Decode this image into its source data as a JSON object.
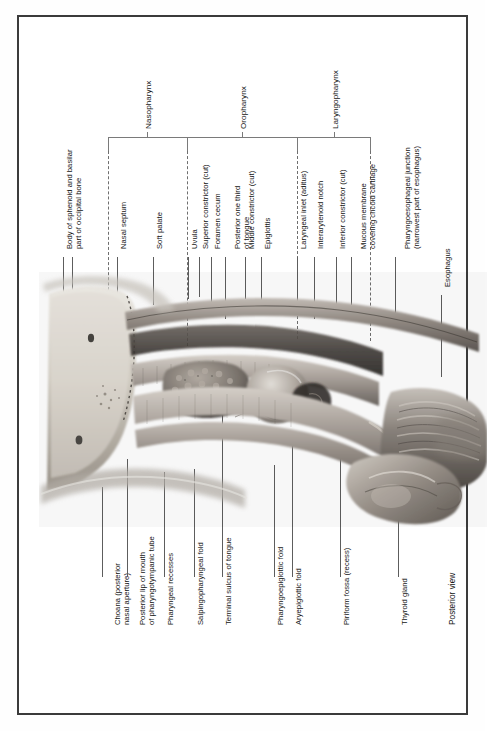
{
  "figure": {
    "view_caption": "Posterior view",
    "orientation": "labels rotated 90 degrees counter-clockwise",
    "regions": [
      {
        "name": "Nasopharynx"
      },
      {
        "name": "Oropharynx"
      },
      {
        "name": "Laryngopharynx"
      }
    ],
    "labels_top": [
      {
        "text": "Body of sphenoid and basilar\npart of occipital bone"
      },
      {
        "text": "Nasal septum"
      },
      {
        "text": "Soft palate"
      },
      {
        "text": "Uvula"
      },
      {
        "text": "Superior constrictor (cut)"
      },
      {
        "text": "Foramen cecum"
      },
      {
        "text": "Posterior one third\nof tongue"
      },
      {
        "text": "Middle constrictor (cut)"
      },
      {
        "text": "Epiglottis"
      },
      {
        "text": "Laryngeal inlet (aditus)"
      },
      {
        "text": "Interarytenoid notch"
      },
      {
        "text": "Inferior constrictor (cut)"
      },
      {
        "text": "Mucous membrane\ncovering cricoid cartilage"
      },
      {
        "text": "Pharyngoesophageal junction\n(narrowest part of esophagus)"
      },
      {
        "text": "Esophagus"
      }
    ],
    "labels_bottom": [
      {
        "text": "Choana (posterior\nnasal aperture)"
      },
      {
        "text": "Posterior lip of mouth\nof pharyngotympanic tube"
      },
      {
        "text": "Pharyngeal recesses"
      },
      {
        "text": "Salpingopharyngeal fold"
      },
      {
        "text": "Terminal sulcus of tongue"
      },
      {
        "text": "Pharyngoepiglottic fold"
      },
      {
        "text": "Aryepiglottic fold"
      },
      {
        "text": "Piriform fossa (recess)"
      },
      {
        "text": "Thyroid gland"
      }
    ],
    "colors": {
      "border": "#3b3b3b",
      "leader": "#5d5d5d",
      "bracket": "#7a7a7a",
      "text": "#141414",
      "page": "#ffffff"
    }
  }
}
